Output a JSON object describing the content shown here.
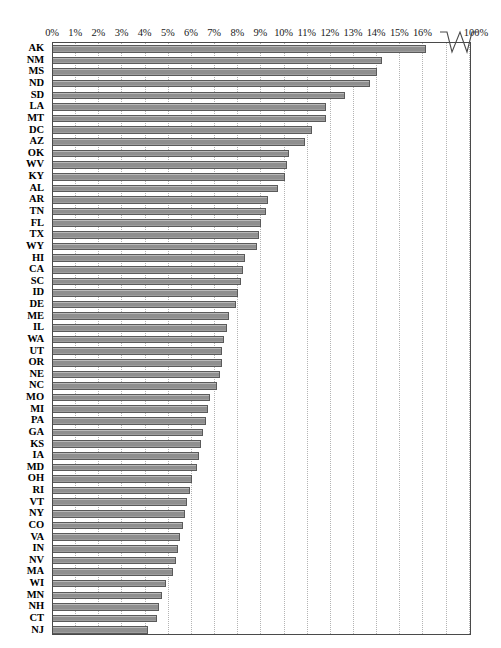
{
  "chart_data": {
    "type": "bar",
    "orientation": "horizontal",
    "title": "",
    "xlabel": "",
    "ylabel": "",
    "xlim": [
      0,
      16.5
    ],
    "grid": true,
    "legend": null,
    "axis_break": {
      "present": true,
      "after_tick": "16%",
      "final_tick": "100%"
    },
    "xticks": [
      "0%",
      "1%",
      "2%",
      "3%",
      "4%",
      "5%",
      "6%",
      "7%",
      "8%",
      "9%",
      "10%",
      "11%",
      "12%",
      "13%",
      "14%",
      "15%",
      "16%"
    ],
    "xtick_values": [
      0,
      1,
      2,
      3,
      4,
      5,
      6,
      7,
      8,
      9,
      10,
      11,
      12,
      13,
      14,
      15,
      16
    ],
    "extra_tick_label": "100%",
    "categories": [
      "AK",
      "NM",
      "MS",
      "ND",
      "SD",
      "LA",
      "MT",
      "DC",
      "AZ",
      "OK",
      "WV",
      "KY",
      "AL",
      "AR",
      "TN",
      "FL",
      "TX",
      "WY",
      "HI",
      "CA",
      "SC",
      "ID",
      "DE",
      "ME",
      "IL",
      "WA",
      "UT",
      "OR",
      "NE",
      "NC",
      "MO",
      "MI",
      "PA",
      "GA",
      "KS",
      "IA",
      "MD",
      "OH",
      "RI",
      "VT",
      "NY",
      "CO",
      "VA",
      "IN",
      "NV",
      "MA",
      "WI",
      "MN",
      "NH",
      "CT",
      "NJ"
    ],
    "values": [
      16.1,
      14.2,
      14.0,
      13.7,
      12.6,
      11.8,
      11.8,
      11.2,
      10.9,
      10.2,
      10.1,
      10.0,
      9.7,
      9.3,
      9.2,
      9.0,
      8.9,
      8.8,
      8.3,
      8.2,
      8.1,
      8.0,
      7.9,
      7.6,
      7.5,
      7.4,
      7.3,
      7.3,
      7.2,
      7.1,
      6.8,
      6.7,
      6.6,
      6.5,
      6.4,
      6.3,
      6.2,
      6.0,
      5.9,
      5.8,
      5.7,
      5.6,
      5.5,
      5.4,
      5.3,
      5.2,
      4.9,
      4.7,
      4.6,
      4.5,
      4.1
    ],
    "series": [
      {
        "name": "percent",
        "values": [
          16.1,
          14.2,
          14.0,
          13.7,
          12.6,
          11.8,
          11.8,
          11.2,
          10.9,
          10.2,
          10.1,
          10.0,
          9.7,
          9.3,
          9.2,
          9.0,
          8.9,
          8.8,
          8.3,
          8.2,
          8.1,
          8.0,
          7.9,
          7.6,
          7.5,
          7.4,
          7.3,
          7.3,
          7.2,
          7.1,
          6.8,
          6.7,
          6.6,
          6.5,
          6.4,
          6.3,
          6.2,
          6.0,
          5.9,
          5.8,
          5.7,
          5.6,
          5.5,
          5.4,
          5.3,
          5.2,
          4.9,
          4.7,
          4.6,
          4.5,
          4.1
        ]
      }
    ],
    "colors": {
      "bar_fill": "#8f8f8f",
      "bar_border": "#5a5a5a",
      "gridline": "#b4b4b4",
      "frame": "#4a4a4a",
      "text": "#000000",
      "background": "#ffffff"
    }
  }
}
